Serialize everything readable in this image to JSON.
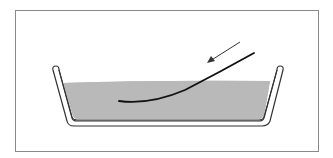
{
  "diagram": {
    "colors": {
      "frame": "#8a8a8a",
      "tray_outline": "#333333",
      "liquid": "#b9b9b9",
      "strip": "#111111",
      "arrow": "#333333",
      "background": "#ffffff"
    },
    "elements": [
      {
        "id": "frame",
        "type": "border"
      },
      {
        "id": "tray",
        "type": "container"
      },
      {
        "id": "liquid",
        "type": "fill"
      },
      {
        "id": "strip",
        "type": "curve"
      },
      {
        "id": "arrow",
        "type": "direction-arrow"
      }
    ]
  }
}
